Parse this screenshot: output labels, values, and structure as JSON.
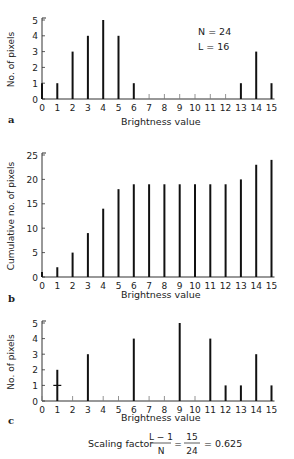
{
  "chart_data": [
    {
      "panel": "a",
      "type": "bar",
      "categories": [
        0,
        1,
        2,
        3,
        4,
        5,
        6,
        7,
        8,
        9,
        10,
        11,
        12,
        13,
        14,
        15
      ],
      "values": [
        1,
        1,
        3,
        4,
        5,
        4,
        1,
        0,
        0,
        0,
        0,
        0,
        0,
        1,
        3,
        1
      ],
      "xlabel": "Brightness value",
      "ylabel": "No. of pixels",
      "ylim": [
        0,
        5
      ],
      "yticks": [
        0,
        1,
        2,
        3,
        4,
        5
      ],
      "annotations": [
        "N = 24",
        "L = 16"
      ]
    },
    {
      "panel": "b",
      "type": "bar",
      "categories": [
        0,
        1,
        2,
        3,
        4,
        5,
        6,
        7,
        8,
        9,
        10,
        11,
        12,
        13,
        14,
        15
      ],
      "values": [
        1,
        2,
        5,
        9,
        14,
        18,
        19,
        19,
        19,
        19,
        19,
        19,
        19,
        20,
        23,
        24
      ],
      "xlabel": "Brightness value",
      "ylabel": "Cumulative no. of pixels",
      "ylim": [
        0,
        25
      ],
      "yticks": [
        0,
        5,
        10,
        15,
        20,
        25
      ]
    },
    {
      "panel": "c",
      "type": "bar",
      "categories": [
        0,
        1,
        2,
        3,
        4,
        5,
        6,
        7,
        8,
        9,
        10,
        11,
        12,
        13,
        14,
        15
      ],
      "values": [
        0,
        2,
        0,
        3,
        0,
        0,
        4,
        0,
        0,
        5,
        0,
        4,
        1,
        1,
        3,
        1
      ],
      "xlabel": "Brightness value",
      "ylabel": "No. of pixels",
      "ylim": [
        0,
        5
      ],
      "yticks": [
        0,
        1,
        2,
        3,
        4,
        5
      ],
      "marker": {
        "x": 1,
        "y": 1
      },
      "annotations": [
        "Scaling factor (L-1)/N = 15/24 = 0.625"
      ]
    }
  ],
  "labels": {
    "panel_a": "a",
    "panel_b": "b",
    "panel_c": "c",
    "annot_n": "N = 24",
    "annot_l": "L = 16",
    "scaling_prefix": "Scaling factor",
    "frac1_num": "L − 1",
    "frac1_den": "N",
    "eq": "=",
    "frac2_num": "15",
    "frac2_den": "24",
    "result": "= 0.625"
  }
}
